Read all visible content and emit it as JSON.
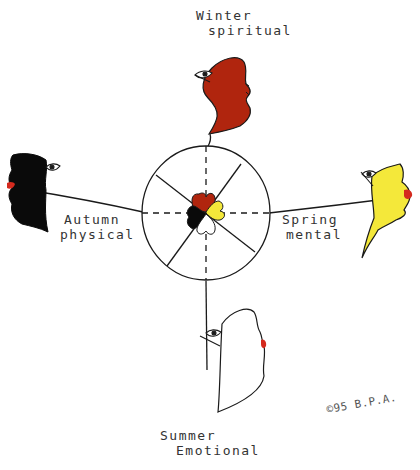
{
  "diagram": {
    "type": "medicine-wheel",
    "directions": [
      {
        "key": "winter",
        "season": "Winter",
        "aspect": "spiritual",
        "position": "top",
        "color": "#b0250e"
      },
      {
        "key": "autumn",
        "season": "Autumn",
        "aspect": "physical",
        "position": "left",
        "color": "#0a0a0a"
      },
      {
        "key": "spring",
        "season": "Spring",
        "aspect": "mental",
        "position": "right",
        "color": "#f4e83a"
      },
      {
        "key": "summer",
        "season": "Summer",
        "aspect": "Emotional",
        "position": "bottom",
        "color": "#ffffff"
      }
    ],
    "labels": {
      "winter": {
        "line1": "Winter",
        "line2": "spiritual"
      },
      "autumn": {
        "line1": "Autumn",
        "line2": "physical"
      },
      "spring": {
        "line1": "Spring",
        "line2": "mental"
      },
      "summer": {
        "line1": "Summer",
        "line2": "Emotional"
      }
    },
    "signature": "©95 B.P.A.",
    "colors": {
      "lips": "#d42a1e",
      "outline": "#1a1a1a",
      "background": "#ffffff"
    }
  }
}
